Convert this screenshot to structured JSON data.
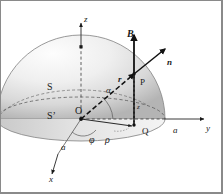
{
  "figure": {
    "title_alt": "Hemispherical surface S in a uniform magnetic field B",
    "background_color": "#ffffff",
    "frame_color": "#8a8a8a",
    "ink_color": "#1a1a1a",
    "surface_fill_light": "#fbfbfb",
    "surface_fill_dark": "#b9b9b9"
  },
  "axes": [
    {
      "id": "z",
      "label": "z",
      "style": "serif-italic",
      "x": 83,
      "y": 14,
      "size": 9
    },
    {
      "id": "y",
      "label": "y",
      "style": "serif-italic",
      "x": 205,
      "y": 123,
      "size": 9
    },
    {
      "id": "x",
      "label": "x",
      "style": "serif-italic",
      "x": 48,
      "y": 174,
      "size": 9
    }
  ],
  "vectors": [
    {
      "id": "B",
      "label": "B",
      "style": "bold-italic",
      "x": 126,
      "y": 28,
      "size": 10,
      "description": "uniform magnetic field, vertical up"
    },
    {
      "id": "n",
      "label": "n",
      "style": "bold-italic",
      "x": 166,
      "y": 57,
      "size": 9,
      "description": "outward unit normal at P"
    },
    {
      "id": "r",
      "label": "r",
      "style": "bold-italic",
      "x": 117,
      "y": 74,
      "size": 9,
      "description": "position vector from O to P"
    },
    {
      "id": "rho",
      "label": "ρ",
      "style": "serif-italic",
      "x": 104,
      "y": 134,
      "size": 10,
      "description": "cylindrical radial distance O to Q"
    }
  ],
  "points": [
    {
      "id": "O",
      "label": "O",
      "style": "serif-plain",
      "x": 74,
      "y": 105,
      "size": 10
    },
    {
      "id": "P",
      "label": "P",
      "style": "serif-plain",
      "x": 139,
      "y": 77,
      "size": 9
    },
    {
      "id": "Q",
      "label": "Q",
      "style": "serif-plain",
      "x": 141,
      "y": 126,
      "size": 9
    }
  ],
  "surfaces": [
    {
      "id": "S",
      "label": "S",
      "style": "serif-plain",
      "x": 46,
      "y": 81,
      "size": 10,
      "description": "hemispherical cap surface"
    },
    {
      "id": "S-prime",
      "label": "S’",
      "style": "serif-plain",
      "x": 46,
      "y": 110,
      "size": 10,
      "description": "flat circular base surface"
    }
  ],
  "measures": [
    {
      "id": "alpha-angle",
      "label": "α",
      "style": "serif-italic",
      "x": 105,
      "y": 85,
      "size": 9,
      "description": "polar angle between r and base plane"
    },
    {
      "id": "phi-angle",
      "label": "φ",
      "style": "serif-italic",
      "x": 88,
      "y": 134,
      "size": 10,
      "description": "azimuthal angle from x-axis"
    },
    {
      "id": "z-height",
      "label": "z",
      "style": "serif-italic",
      "x": 136,
      "y": 103,
      "size": 7,
      "description": "height of P above base plane"
    },
    {
      "id": "radius-y",
      "label": "a",
      "style": "serif-italic",
      "x": 172,
      "y": 125,
      "size": 9,
      "description": "hemisphere radius marked on y-axis"
    },
    {
      "id": "radius-x",
      "label": "a",
      "style": "serif-italic",
      "x": 60,
      "y": 142,
      "size": 9,
      "description": "hemisphere radius marked on x-axis"
    }
  ],
  "geometry": {
    "origin": {
      "x": 80,
      "y": 118
    },
    "radius_px": 84,
    "base_ellipse_ry": 22,
    "point_P": {
      "x": 133,
      "y": 73
    },
    "point_Q": {
      "x": 133,
      "y": 123
    }
  }
}
